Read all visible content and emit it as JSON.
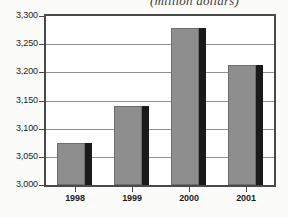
{
  "chart_data": {
    "type": "bar",
    "title": "(million dollars)",
    "title_note": "partially cropped at top edge of image",
    "xlabel": "",
    "ylabel": "",
    "categories": [
      "1998",
      "1999",
      "2000",
      "2001"
    ],
    "values": [
      3075,
      3140,
      3278,
      3213
    ],
    "ylim": [
      3000,
      3300
    ],
    "ytick_values": [
      3000,
      3050,
      3100,
      3150,
      3200,
      3250,
      3300
    ],
    "ytick_labels": [
      "3,000",
      "3,050",
      "3,100",
      "3,150",
      "3,200",
      "3,250",
      "3,300"
    ],
    "grid": true,
    "legend": null,
    "legend_position": "none",
    "series": [
      {
        "name": "value",
        "values": [
          3075,
          3140,
          3278,
          3213
        ]
      }
    ],
    "colors": {
      "bar_fill": "#8e8e8e",
      "bar_edge": "#6d6d6d",
      "bar_shadow": "#1a1a1a",
      "gridline": "#8f8f8f",
      "frame": "#4a4a4a",
      "text": "#1d1d1d",
      "background": "#ffffff"
    }
  }
}
